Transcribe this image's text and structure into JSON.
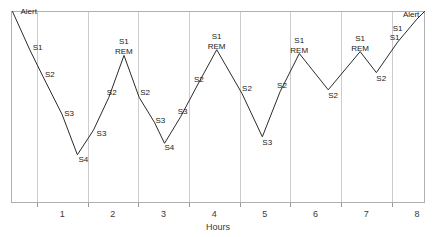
{
  "chart_data": {
    "type": "line",
    "title": "",
    "subtitle": "",
    "xlabel": "Hours",
    "ylabel": "",
    "xlim": [
      0,
      8.15
    ],
    "ylim": [
      0,
      5
    ],
    "grid": true,
    "legend": false,
    "legend_position": "none",
    "x_tick_labels": [
      "1",
      "2",
      "3",
      "4",
      "5",
      "6",
      "7",
      "8"
    ],
    "x_ticks": [
      1,
      2,
      3,
      4,
      5,
      6,
      7,
      8
    ],
    "y_stage_levels": {
      "Alert": 5,
      "S1": 4,
      "REM": 4,
      "S2": 3,
      "S3": 2,
      "S4": 1
    },
    "series": [
      {
        "name": "Sleep stage",
        "color": "#2b2b2b",
        "points": [
          {
            "x": 0.02,
            "y": 5.0,
            "stage": "Alert",
            "label": "Alert",
            "label_dx": 8,
            "label_dy": 2
          },
          {
            "x": 0.36,
            "y": 4.0,
            "stage": "S1",
            "label": "S1",
            "label_dx": 3,
            "label_dy": 0
          },
          {
            "x": 0.62,
            "y": 3.3,
            "stage": "S2",
            "label": "S2",
            "label_dx": 2,
            "label_dy": 1
          },
          {
            "x": 1.0,
            "y": 2.3,
            "stage": "S3",
            "label": "S3",
            "label_dx": 2,
            "label_dy": 1
          },
          {
            "x": 1.3,
            "y": 1.25,
            "stage": "S4",
            "label": "S4",
            "label_dx": 1,
            "label_dy": 7
          },
          {
            "x": 1.62,
            "y": 1.9,
            "stage": "S3",
            "label": "S3",
            "label_dx": 3,
            "label_dy": 6
          },
          {
            "x": 1.92,
            "y": 2.75,
            "stage": "S2",
            "label": "S2",
            "label_dx": -2,
            "label_dy": -2
          },
          {
            "x": 2.22,
            "y": 3.85,
            "stage": "REM",
            "label": "REM",
            "label_dx": -9,
            "label_dy": -1
          },
          {
            "x": 2.52,
            "y": 2.75,
            "stage": "S2",
            "label": "S2",
            "label_dx": 1,
            "label_dy": -2
          },
          {
            "x": 2.82,
            "y": 2.1,
            "stage": "S3",
            "label": "S3",
            "label_dx": 1,
            "label_dy": 1
          },
          {
            "x": 3.02,
            "y": 1.55,
            "stage": "S4",
            "label": "S4",
            "label_dx": 0,
            "label_dy": 7
          },
          {
            "x": 3.34,
            "y": 2.25,
            "stage": "S3",
            "label": "S3",
            "label_dx": -3,
            "label_dy": -3
          },
          {
            "x": 3.66,
            "y": 3.05,
            "stage": "S2",
            "label": "S2",
            "label_dx": -3,
            "label_dy": -4
          },
          {
            "x": 4.05,
            "y": 4.0,
            "stage": "REM",
            "label": "REM",
            "label_dx": -9,
            "label_dy": -1
          },
          {
            "x": 4.55,
            "y": 2.85,
            "stage": "S2",
            "label": "S2",
            "label_dx": 0,
            "label_dy": -3
          },
          {
            "x": 4.95,
            "y": 1.72,
            "stage": "S3",
            "label": "S3",
            "label_dx": 0,
            "label_dy": 8
          },
          {
            "x": 5.3,
            "y": 2.9,
            "stage": "S2",
            "label": "S2",
            "label_dx": -3,
            "label_dy": -4
          },
          {
            "x": 5.68,
            "y": 3.9,
            "stage": "REM",
            "label": "REM",
            "label_dx": -9,
            "label_dy": -1
          },
          {
            "x": 6.25,
            "y": 2.95,
            "stage": "S2",
            "label": "S2",
            "label_dx": 0,
            "label_dy": 8
          },
          {
            "x": 6.88,
            "y": 3.95,
            "stage": "REM",
            "label": "REM",
            "label_dx": -9,
            "label_dy": -1
          },
          {
            "x": 7.2,
            "y": 3.4,
            "stage": "S2",
            "label": "S2",
            "label_dx": 0,
            "label_dy": 8
          },
          {
            "x": 7.62,
            "y": 4.2,
            "stage": "S1",
            "label": "S1",
            "label_dx": -8,
            "label_dy": -2
          },
          {
            "x": 8.0,
            "y": 4.8,
            "stage": "Alert",
            "label": "Alert",
            "label_dx": -14,
            "label_dy": -2
          },
          {
            "x": 8.15,
            "y": 5.0,
            "stage": "Alert",
            "label": "",
            "label_dx": 0,
            "label_dy": 0
          }
        ]
      }
    ],
    "peak_top_labels": [
      {
        "x": 2.22,
        "y": 3.85,
        "label": "S1",
        "dx": -5,
        "dy": -11
      },
      {
        "x": 4.05,
        "y": 4.0,
        "label": "S1",
        "dx": -5,
        "dy": -11
      },
      {
        "x": 5.68,
        "y": 3.9,
        "label": "S1",
        "dx": -5,
        "dy": -11
      },
      {
        "x": 6.88,
        "y": 3.95,
        "label": "S1",
        "dx": -5,
        "dy": -11
      },
      {
        "x": 7.62,
        "y": 4.2,
        "label": "S1",
        "dx": -5,
        "dy": -11
      }
    ]
  }
}
